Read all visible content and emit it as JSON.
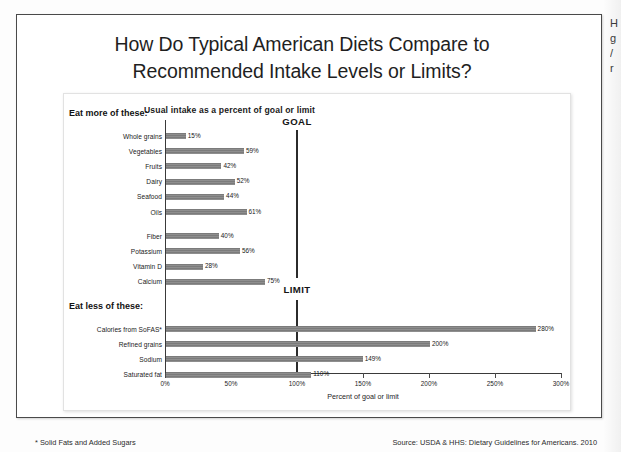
{
  "slide": {
    "title_line1": "How Do Typical American Diets Compare to",
    "title_line2": "Recommended Intake Levels or Limits?",
    "footnote": "* Solid Fats and Added Sugars",
    "source": "Source: USDA & HHS: Dietary Guidelines for Americans. 2010"
  },
  "margin_notes": {
    "line1": "H",
    "line2": "g",
    "line3": "/",
    "line4": "r"
  },
  "chart_data": {
    "type": "bar",
    "orientation": "horizontal",
    "title": "Usual intake as a percent of goal or limit",
    "xlabel": "Percent of goal or limit",
    "ylabel": "",
    "xlim": [
      0,
      300
    ],
    "xticks": [
      0,
      50,
      100,
      150,
      200,
      250,
      300
    ],
    "xtick_labels": [
      "0%",
      "50%",
      "100%",
      "150%",
      "200%",
      "250%",
      "300%"
    ],
    "grid": false,
    "legend": "none",
    "bar_color": "#858585",
    "marker_color": "#2b2b2b",
    "groups": [
      {
        "heading": "Eat more of these:",
        "reference_label": "GOAL",
        "reference_value": 100,
        "blocks": [
          {
            "categories": [
              "Whole grains",
              "Vegetables",
              "Fruits",
              "Dairy",
              "Seafood",
              "Oils"
            ],
            "values": [
              15,
              59,
              42,
              52,
              44,
              61
            ],
            "value_labels": [
              "15%",
              "59%",
              "42%",
              "52%",
              "44%",
              "61%"
            ]
          },
          {
            "categories": [
              "Fiber",
              "Potassium",
              "Vitamin D",
              "Calcium"
            ],
            "values": [
              40,
              56,
              28,
              75
            ],
            "value_labels": [
              "40%",
              "56%",
              "28%",
              "75%"
            ]
          }
        ]
      },
      {
        "heading": "Eat less of these:",
        "reference_label": "LIMIT",
        "reference_value": 100,
        "blocks": [
          {
            "categories": [
              "Calories from SoFAS*",
              "Refined grains",
              "Sodium",
              "Saturated fat"
            ],
            "values": [
              280,
              200,
              149,
              110
            ],
            "value_labels": [
              "280%",
              "200%",
              "149%",
              "110%"
            ]
          }
        ]
      }
    ]
  }
}
